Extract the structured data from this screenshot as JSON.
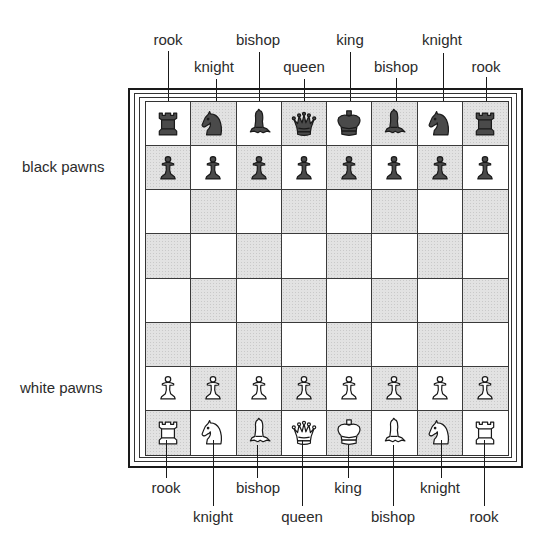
{
  "diagram": {
    "colors": {
      "light_square": "#ffffff",
      "dark_square": "#e2e2e2",
      "black_piece_fill": "#4a4a4a",
      "white_piece_fill": "#ffffff",
      "outline": "#1a1a1a"
    },
    "top_labels_row1": [
      "rook",
      "bishop",
      "king",
      "knight"
    ],
    "top_labels_row2": [
      "knight",
      "queen",
      "bishop",
      "rook"
    ],
    "bottom_labels_row1": [
      "rook",
      "bishop",
      "king",
      "knight"
    ],
    "bottom_labels_row2": [
      "knight",
      "queen",
      "bishop",
      "rook"
    ],
    "side_labels": {
      "black_pawns": "black pawns",
      "white_pawns": "white pawns"
    },
    "board": {
      "files": 8,
      "ranks": 8,
      "top_left_square": "light",
      "rows": [
        [
          "bR",
          "bN",
          "bB",
          "bQ",
          "bK",
          "bB",
          "bN",
          "bR"
        ],
        [
          "bP",
          "bP",
          "bP",
          "bP",
          "bP",
          "bP",
          "bP",
          "bP"
        ],
        [
          "",
          "",
          "",
          "",
          "",
          "",
          "",
          ""
        ],
        [
          "",
          "",
          "",
          "",
          "",
          "",
          "",
          ""
        ],
        [
          "",
          "",
          "",
          "",
          "",
          "",
          "",
          ""
        ],
        [
          "",
          "",
          "",
          "",
          "",
          "",
          "",
          ""
        ],
        [
          "wP",
          "wP",
          "wP",
          "wP",
          "wP",
          "wP",
          "wP",
          "wP"
        ],
        [
          "wR",
          "wN",
          "wB",
          "wQ",
          "wK",
          "wB",
          "wN",
          "wR"
        ]
      ],
      "piece_names": {
        "R": "rook",
        "N": "knight",
        "B": "bishop",
        "Q": "queen",
        "K": "king",
        "P": "pawn"
      }
    }
  }
}
